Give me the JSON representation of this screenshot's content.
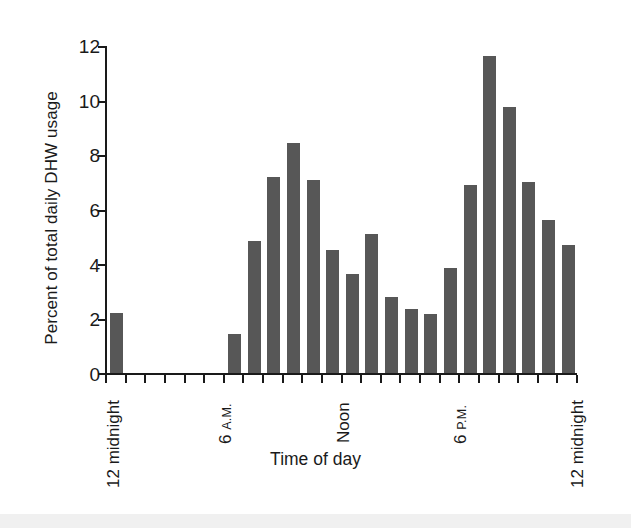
{
  "chart_data": {
    "type": "bar",
    "title": "",
    "xlabel": "Time of day",
    "ylabel": "Percent of total daily DHW usage",
    "ylim": [
      0,
      12
    ],
    "yticks": [
      0,
      2,
      4,
      6,
      8,
      10,
      12
    ],
    "ytick_labels": [
      "0",
      "2",
      "4",
      "6",
      "8",
      "10",
      "12"
    ],
    "grid": false,
    "legend": null,
    "bar_color": "#575757",
    "axis_color": "#1a1a1a",
    "categories": [
      "12 midnight",
      "1 A.M.",
      "2 A.M.",
      "3 A.M.",
      "4 A.M.",
      "5 A.M.",
      "6 A.M.",
      "7 A.M.",
      "8 A.M.",
      "9 A.M.",
      "10 A.M.",
      "11 A.M.",
      "Noon",
      "1 P.M.",
      "2 P.M.",
      "3 P.M.",
      "4 P.M.",
      "5 P.M.",
      "6 P.M.",
      "7 P.M.",
      "8 P.M.",
      "9 P.M.",
      "10 P.M.",
      "11 P.M."
    ],
    "values": [
      2.2,
      0,
      0,
      0,
      0,
      0,
      1.45,
      4.85,
      7.2,
      8.45,
      7.1,
      4.5,
      3.65,
      5.1,
      2.8,
      2.35,
      2.15,
      3.85,
      6.9,
      11.65,
      9.75,
      7.0,
      5.6,
      4.7
    ],
    "xtick_labels_shown": [
      {
        "index": 0,
        "text": "12 midnight",
        "small_suffix": ""
      },
      {
        "index": 6,
        "text": "6 ",
        "small_suffix": "A.M."
      },
      {
        "index": 12,
        "text": "Noon",
        "small_suffix": ""
      },
      {
        "index": 18,
        "text": "6 ",
        "small_suffix": "P.M."
      },
      {
        "index": 24,
        "text": "12 midnight",
        "small_suffix": ""
      }
    ]
  },
  "axes": {
    "y_title": "Percent of total daily DHW usage",
    "x_title": "Time of day",
    "y_labels": {
      "t0": "0",
      "t2": "2",
      "t4": "4",
      "t6": "6",
      "t8": "8",
      "t10": "10",
      "t12": "12"
    },
    "x_labels": {
      "midnight_left_main": "12 midnight",
      "six_am_main": "6 ",
      "six_am_small": "A.M.",
      "noon_main": "Noon",
      "six_pm_main": "6 ",
      "six_pm_small": "P.M.",
      "midnight_right_main": "12 midnight"
    }
  }
}
